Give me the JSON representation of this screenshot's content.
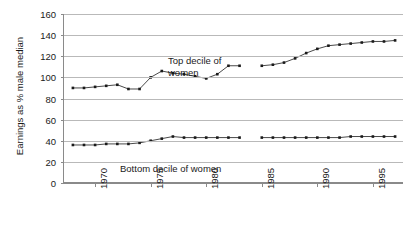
{
  "chart_data": {
    "type": "line",
    "title": "",
    "xlabel": "",
    "ylabel": "Earnings as % male median",
    "xlim": [
      1967.2,
      1997.8
    ],
    "ylim": [
      0,
      160
    ],
    "grid": true,
    "legend_position": "inline-annotations",
    "y_ticks": [
      0,
      20,
      40,
      60,
      80,
      100,
      120,
      140,
      160
    ],
    "x_ticks": [
      1970,
      1975,
      1980,
      1985,
      1990,
      1995
    ],
    "annotations": [
      {
        "name": "top-series-label",
        "text": "Top decile of\nwomen"
      },
      {
        "name": "bottom-series-label",
        "text": "Bottom decile of women"
      }
    ],
    "series": [
      {
        "name": "Top decile of women",
        "marker": "square",
        "color": "#1a1a1a",
        "x": [
          1968,
          1969,
          1970,
          1971,
          1972,
          1973,
          1974,
          1975,
          1976,
          1977,
          1978,
          1979,
          1980,
          1981,
          1982,
          1983,
          1985,
          1986,
          1987,
          1988,
          1989,
          1990,
          1991,
          1992,
          1993,
          1994,
          1995,
          1996,
          1997
        ],
        "values": [
          90,
          90,
          91,
          92,
          93,
          89,
          89,
          100,
          106,
          104,
          103,
          101,
          99,
          103,
          111,
          111,
          111,
          112,
          114,
          118,
          123,
          127,
          130,
          131,
          132,
          133,
          134,
          134,
          135
        ]
      },
      {
        "name": "Bottom decile of women",
        "marker": "square",
        "color": "#1a1a1a",
        "x": [
          1968,
          1969,
          1970,
          1971,
          1972,
          1973,
          1974,
          1975,
          1976,
          1977,
          1978,
          1979,
          1980,
          1981,
          1982,
          1983,
          1985,
          1986,
          1987,
          1988,
          1989,
          1990,
          1991,
          1992,
          1993,
          1994,
          1995,
          1996,
          1997
        ],
        "values": [
          36,
          36,
          36,
          37,
          37,
          37,
          38,
          40,
          42,
          44,
          43,
          43,
          43,
          43,
          43,
          43,
          43,
          43,
          43,
          43,
          43,
          43,
          43,
          43,
          44,
          44,
          44,
          44,
          44
        ]
      }
    ]
  },
  "axis": {
    "y_title": "Earnings as % male median",
    "y_tick_labels": [
      "0",
      "20",
      "40",
      "60",
      "80",
      "100",
      "120",
      "140",
      "160"
    ],
    "x_tick_labels": [
      "1970",
      "1975",
      "1980",
      "1985",
      "1990",
      "1995"
    ]
  },
  "labels": {
    "top_line1": "Top decile of",
    "top_line2": "women",
    "bottom": "Bottom decile of women"
  }
}
